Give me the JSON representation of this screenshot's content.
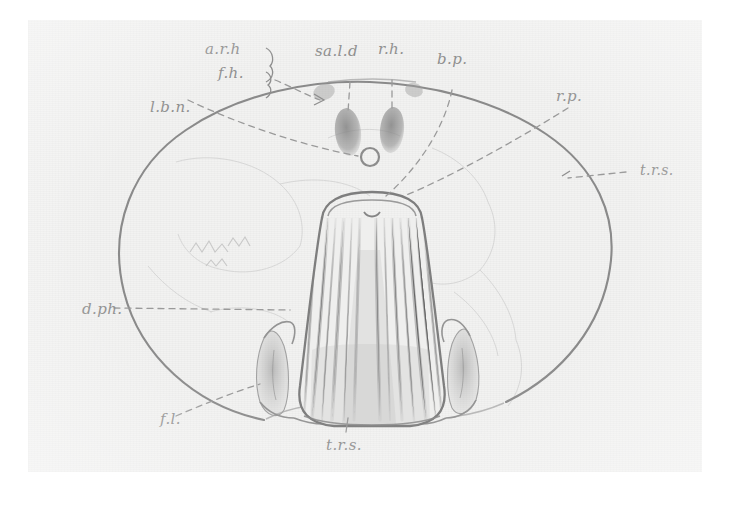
{
  "figure": {
    "kind": "pencil-anatomical-cross-section-drawing",
    "medium": "graphite pencil on paper",
    "background_color": "#f2f2f1",
    "ink_color": "#8e8e8e",
    "frame_color": "#ffffff",
    "orientation": "transverse section, outer oval body wall with central striated bell-shaped organ"
  },
  "labels": [
    {
      "id": "a-r-h",
      "text": "a.r.h",
      "x": 205,
      "y": 38,
      "leader": "brace-right-dashed"
    },
    {
      "id": "f-h",
      "text": "f.h.",
      "x": 218,
      "y": 62,
      "leader": "brace-right-dashed"
    },
    {
      "id": "sa-l-d",
      "text": "sa.l.d",
      "x": 315,
      "y": 40,
      "leader": "dashed-down"
    },
    {
      "id": "r-h",
      "text": "r.h.",
      "x": 378,
      "y": 38,
      "leader": "dashed-down"
    },
    {
      "id": "b-p",
      "text": "b.p.",
      "x": 437,
      "y": 48,
      "leader": "dashed-down-right"
    },
    {
      "id": "r-p",
      "text": "r.p.",
      "x": 556,
      "y": 85,
      "leader": "dashed-down-left"
    },
    {
      "id": "l-b-n",
      "text": "l.b.n.",
      "x": 150,
      "y": 96,
      "leader": "dashed-right-down"
    },
    {
      "id": "t-r-s-right",
      "text": "t.r.s.",
      "x": 640,
      "y": 160,
      "leader": "dashed-left"
    },
    {
      "id": "d-ph",
      "text": "d.ph.",
      "x": 82,
      "y": 298,
      "leader": "dashed-right"
    },
    {
      "id": "f-l",
      "text": "f.l.",
      "x": 160,
      "y": 408,
      "leader": "dashed-up-right"
    },
    {
      "id": "t-r-s-bottom",
      "text": "t.r.s.",
      "x": 326,
      "y": 434,
      "leader": "dashed-up"
    }
  ],
  "structures": {
    "outer_wall": "large oval body outline",
    "central_organ": "bell / trapezoid shaped striated mass with vertical fibre lines",
    "paired_ovals": "two dark elongate ovals at dorsal midline",
    "small_circle": "small ring below the paired ovals",
    "lateral_leaflets": "paired shaded leaf-shaped structures flanking the central organ",
    "faint_contours": "light internal contour lines across the body cavity"
  }
}
